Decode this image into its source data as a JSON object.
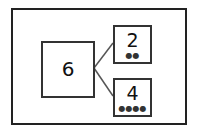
{
  "diagram": {
    "whole": {
      "value": "6"
    },
    "parts": [
      {
        "value": "2",
        "dots": "●●"
      },
      {
        "value": "4",
        "dots": "●●●●"
      }
    ]
  }
}
